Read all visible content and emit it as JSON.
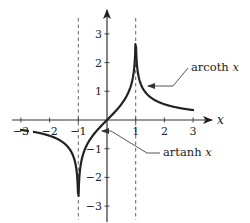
{
  "chart_data": {
    "type": "line",
    "title": "",
    "xlabel": "x",
    "ylabel": "",
    "xlim": [
      -3.3,
      3.5
    ],
    "ylim": [
      -3.3,
      3.7
    ],
    "xticks": [
      -3,
      -2,
      -1,
      1,
      2,
      3
    ],
    "yticks": [
      3,
      2,
      1,
      -1,
      -2,
      -3
    ],
    "xtick_labels": [
      "-3",
      "-2",
      "-1",
      "1",
      "2",
      "3"
    ],
    "ytick_labels": [
      "3",
      "2",
      "1",
      "-1",
      "-2",
      "-3"
    ],
    "asymptotes_x": [
      -1,
      1
    ],
    "grid": false,
    "series": [
      {
        "name": "artanh x",
        "function": "artanh",
        "domain": [
          -0.99,
          0.99
        ],
        "clip_y": [
          -2.7,
          2.7
        ],
        "x": [
          -0.99,
          -0.9,
          -0.75,
          -0.5,
          -0.25,
          0,
          0.25,
          0.5,
          0.75,
          0.9,
          0.99
        ],
        "values": [
          -2.65,
          -1.47,
          -0.97,
          -0.55,
          -0.26,
          0,
          0.26,
          0.55,
          0.97,
          1.47,
          2.65
        ]
      },
      {
        "name": "arcoth x",
        "function": "arcoth",
        "domain_left": [
          -3.0,
          -1.01
        ],
        "domain_right": [
          1.01,
          3.0
        ],
        "clip_y": [
          -2.7,
          2.7
        ],
        "x": [
          -3,
          -2.5,
          -2,
          -1.5,
          -1.2,
          -1.05,
          -1.01,
          1.01,
          1.05,
          1.2,
          1.5,
          2,
          2.5,
          3
        ],
        "values": [
          -0.35,
          -0.42,
          -0.55,
          -0.8,
          -1.2,
          -1.84,
          -2.65,
          2.65,
          1.84,
          1.2,
          0.8,
          0.55,
          0.42,
          0.35
        ]
      }
    ],
    "annotations": [
      {
        "text": "arcoth x",
        "points_to": "arcoth x",
        "at_x": 1.15
      },
      {
        "text": "artanh x",
        "points_to": "artanh x",
        "at_x": -0.4
      }
    ]
  }
}
